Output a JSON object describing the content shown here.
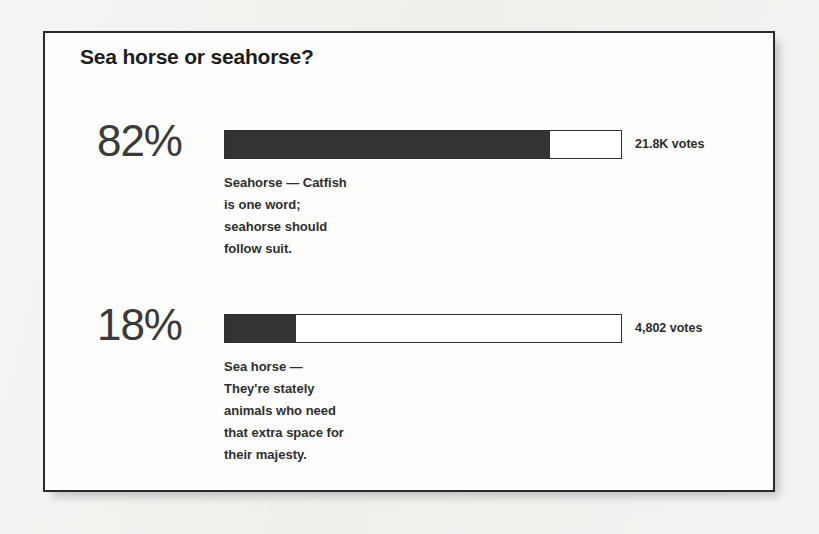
{
  "background": {
    "page_color": "#f2f2f0",
    "card_color": "#fdfdfc",
    "border_color": "#2b2b2b",
    "bar_fill_color": "#333333"
  },
  "poll": {
    "title": "Sea horse or seahorse?",
    "options": [
      {
        "percent_label": "82%",
        "percent_value": 82,
        "votes_label": "21.8K votes",
        "votes_value": 21800,
        "description_lines": [
          "Seahorse — Catfish",
          "is one word;",
          "seahorse should",
          "follow suit."
        ]
      },
      {
        "percent_label": "18%",
        "percent_value": 18,
        "votes_label": "4,802 votes",
        "votes_value": 4802,
        "description_lines": [
          "Sea horse —",
          "They're stately",
          "animals who need",
          "that extra space for",
          "their majesty."
        ]
      }
    ]
  },
  "chart_data": {
    "type": "bar",
    "title": "Sea horse or seahorse?",
    "categories": [
      "Seahorse",
      "Sea horse"
    ],
    "values": [
      82,
      18
    ],
    "value_labels": [
      "82%",
      "18%"
    ],
    "counts": [
      21800,
      4802
    ],
    "count_labels": [
      "21.8K votes",
      "4,802 votes"
    ],
    "xlabel": "",
    "ylabel": "",
    "ylim": [
      0,
      100
    ],
    "grid": false,
    "legend": "none",
    "orientation": "horizontal"
  }
}
